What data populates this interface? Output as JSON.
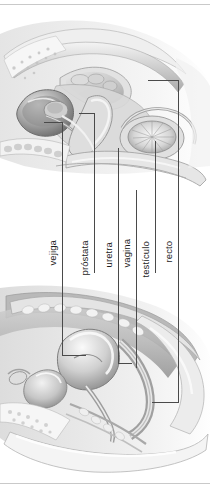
{
  "figure": {
    "kind": "labeled-anatomical-diagram",
    "caption_language": "es",
    "background_color": "#ffffff",
    "line_color": "#4a4a4a",
    "text_color": "#1c1c1c",
    "rule_color": "#c9c9c9",
    "width": 210,
    "height": 490
  },
  "panels": [
    {
      "name": "male-pelvis-sagittal",
      "position": "top"
    },
    {
      "name": "female-pelvis-sagittal",
      "position": "bottom"
    }
  ],
  "labels": [
    {
      "id": "vejiga",
      "text": "vejiga"
    },
    {
      "id": "prostata",
      "text": "próstata"
    },
    {
      "id": "uretra",
      "text": "uretra"
    },
    {
      "id": "vagina",
      "text": "vagina"
    },
    {
      "id": "testiculo",
      "text": "testículo"
    },
    {
      "id": "recto",
      "text": "recto"
    }
  ]
}
